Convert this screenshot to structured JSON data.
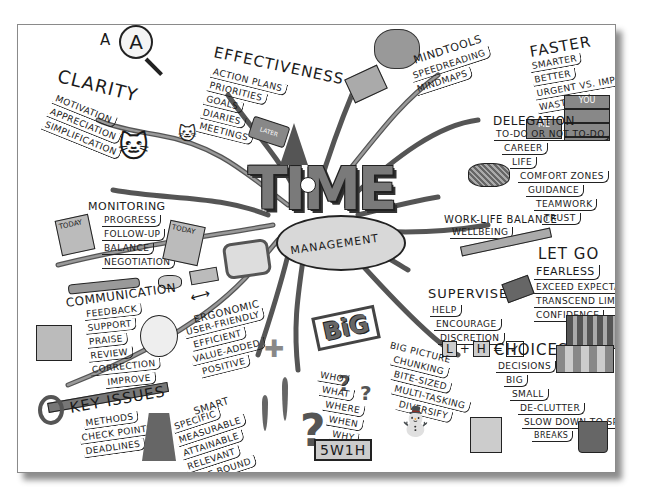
{
  "title": {
    "main": "TIME",
    "sub": "MANAGEMENT"
  },
  "branches": {
    "clarity": {
      "heading": "CLARITY",
      "items": [
        "MOTIVATION",
        "APPRECIATION",
        "SIMPLIFICATION"
      ],
      "icon_label": "A"
    },
    "effectiveness": {
      "heading": "EFFECTIVENESS",
      "items": [
        "ACTION PLANS",
        "PRIORITIES",
        "GOALS",
        "DIARIES",
        "MEETINGS"
      ],
      "book_label": "LATER"
    },
    "mindtools": {
      "heading": "MINDTOOLS",
      "items": [
        "SPEEDREADING",
        "MINDMAPS"
      ]
    },
    "faster": {
      "heading": "FASTER",
      "items": [
        "SMARTER",
        "BETTER",
        "URGENT VS. IMPORTANT",
        "WASTAGE"
      ],
      "book_labels": [
        "YOU",
        "ME"
      ]
    },
    "delegation": {
      "heading": "DELEGATION",
      "items": [
        "TO-DO OR NOT TO-DO",
        "CAREER",
        "LIFE",
        "COMFORT ZONES",
        "GUIDANCE",
        "TEAMWORK",
        "TRUST"
      ]
    },
    "monitoring": {
      "heading": "MONITORING",
      "items": [
        "PROGRESS",
        "FOLLOW-UP",
        "BALANCE",
        "NEGOTIATION"
      ],
      "note_labels": [
        "TODAY",
        "TODAY"
      ]
    },
    "work_life": {
      "heading": "WORK-LIFE BALANCE",
      "items": [
        "WELLBEING"
      ]
    },
    "let_go": {
      "heading": "LET GO",
      "items": [
        "FEARLESS",
        "EXCEED EXPECTATIONS",
        "TRANSCEND LIMITS",
        "CONFIDENCE"
      ]
    },
    "communication": {
      "heading": "COMMUNICATION",
      "items": [
        "FEEDBACK",
        "SUPPORT",
        "PRAISE",
        "REVIEW",
        "CORRECTION",
        "IMPROVE"
      ]
    },
    "supervise": {
      "heading": "SUPERVISE",
      "items": [
        "HELP",
        "ENCOURAGE",
        "DISCRETION"
      ],
      "formula": [
        "L",
        "+",
        "H",
        "=",
        "✓"
      ]
    },
    "ergonomic": {
      "heading": "ERGONOMIC",
      "items": [
        "USER-FRIENDLY",
        "EFFICIENT",
        "VALUE-ADDED",
        "POSITIVE"
      ]
    },
    "big_picture": {
      "heading": "BIG PICTURE",
      "items": [
        "CHUNKING",
        "BITE-SIZED",
        "MULTI-TASKING",
        "DIVERSIFY"
      ],
      "sign": "BiG"
    },
    "choices": {
      "heading": "CHOICES",
      "items": [
        "DECISIONS",
        "BIG",
        "SMALL",
        "DE-CLUTTER",
        "SLOW DOWN TO SPEED UP",
        "BREAKS"
      ]
    },
    "key_issues": {
      "heading": "KEY ISSUES",
      "items": [
        "METHODS",
        "CHECK POINTS",
        "DEADLINES"
      ]
    },
    "smart": {
      "heading": "SMART",
      "items": [
        "SPECIFIC",
        "MEASURABLE",
        "ATTAINABLE",
        "RELEVANT",
        "TIME-BOUND"
      ]
    },
    "five_w": {
      "items": [
        "WHO",
        "WHAT",
        "WHERE",
        "WHEN",
        "WHY",
        "HOW?"
      ],
      "badge": "5W1H"
    }
  },
  "colors": {
    "ink": "#1a1a1a",
    "branch": "#6e6e6e",
    "fill": "#9a9a9a",
    "shadow": "#444444",
    "paper": "#ffffff"
  }
}
